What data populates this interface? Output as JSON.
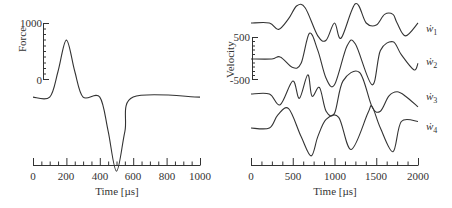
{
  "chart_data": [
    {
      "type": "line",
      "title": "",
      "xlabel": "Time [µs]",
      "ylabel": "Force",
      "xlim": [
        0,
        1000
      ],
      "xticks": [
        "0",
        "200",
        "400",
        "600",
        "800",
        "1000"
      ],
      "yticks": [
        "0",
        "1000"
      ],
      "grid": false,
      "series": [
        {
          "name": "Force",
          "x": [
            0,
            100,
            150,
            200,
            250,
            300,
            400,
            450,
            500,
            550,
            600,
            1000
          ],
          "y": [
            -300,
            -300,
            150,
            700,
            150,
            -300,
            -300,
            -900,
            -1600,
            -900,
            -300,
            -300
          ]
        }
      ]
    },
    {
      "type": "line",
      "title": "",
      "xlabel": "Time [µs]",
      "ylabel": "Velocity",
      "xlim": [
        0,
        2000
      ],
      "xticks": [
        "0",
        "500",
        "1000",
        "1500",
        "2000"
      ],
      "yticks": [
        "500",
        "-500"
      ],
      "grid": false,
      "legend_position": "right",
      "series": [
        {
          "name": "ẇ1",
          "label_main": "ẇ",
          "label_sub": "1",
          "x": [
            0,
            220,
            330,
            450,
            550,
            650,
            800,
            900,
            1000,
            1080,
            1250,
            1380,
            1500,
            1600,
            1700,
            1750,
            1850,
            2000
          ],
          "y": [
            0,
            0,
            -150,
            100,
            400,
            350,
            -300,
            -400,
            0,
            -350,
            450,
            0,
            -50,
            200,
            200,
            0,
            -300,
            0
          ]
        },
        {
          "name": "ẇ2",
          "label_main": "ẇ",
          "label_sub": "2",
          "x": [
            0,
            250,
            350,
            500,
            600,
            700,
            800,
            900,
            1000,
            1150,
            1250,
            1450,
            1550,
            1700,
            1800,
            1950,
            2000
          ],
          "y": [
            0,
            0,
            50,
            -200,
            -100,
            600,
            200,
            -450,
            -600,
            300,
            350,
            -600,
            200,
            400,
            100,
            -250,
            -100
          ]
        },
        {
          "name": "ẇ3",
          "label_main": "ẇ",
          "label_sub": "3",
          "x": [
            0,
            220,
            350,
            500,
            580,
            680,
            730,
            820,
            900,
            1000,
            1100,
            1300,
            1450,
            1550,
            1650,
            1750,
            1850,
            2000
          ],
          "y": [
            0,
            0,
            -250,
            300,
            -100,
            450,
            -50,
            150,
            -400,
            -450,
            300,
            500,
            -300,
            -400,
            -50,
            50,
            -50,
            -300
          ]
        },
        {
          "name": "ẇ4",
          "label_main": "ẇ",
          "label_sub": "4",
          "x": [
            0,
            220,
            320,
            450,
            600,
            720,
            800,
            900,
            1050,
            1200,
            1400,
            1450,
            1550,
            1700,
            1800,
            2000
          ],
          "y": [
            0,
            0,
            300,
            450,
            -200,
            -650,
            -200,
            200,
            250,
            -500,
            350,
            500,
            0,
            -550,
            150,
            150
          ]
        }
      ]
    }
  ]
}
